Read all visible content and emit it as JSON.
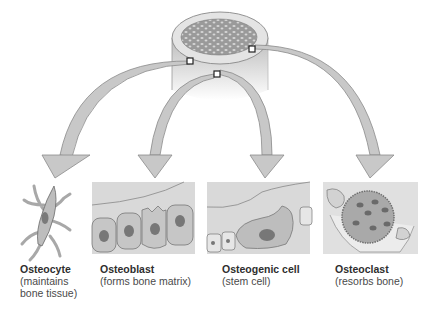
{
  "diagram": {
    "source": "bone cylinder cross-section (compact and spongy bone)",
    "markers": 3,
    "cells": [
      {
        "name": "Osteocyte",
        "desc_lines": [
          "(maintains",
          "bone tissue)"
        ]
      },
      {
        "name": "Osteoblast",
        "desc_lines": [
          "(forms bone matrix)"
        ]
      },
      {
        "name": "Osteogenic cell",
        "desc_lines": [
          "(stem cell)"
        ]
      },
      {
        "name": "Osteoclast",
        "desc_lines": [
          "(resorbs bone)"
        ]
      }
    ],
    "colors": {
      "arrow_fill": "#c8c8c8",
      "arrow_stroke": "#8a8a8a",
      "cell_fill": "#bdbdbd",
      "nucleus": "#7a7a7a",
      "panel_bg": "#d9d9d9",
      "bone_top": "#e2e2e2",
      "spongy": "#8d8d8d"
    }
  }
}
